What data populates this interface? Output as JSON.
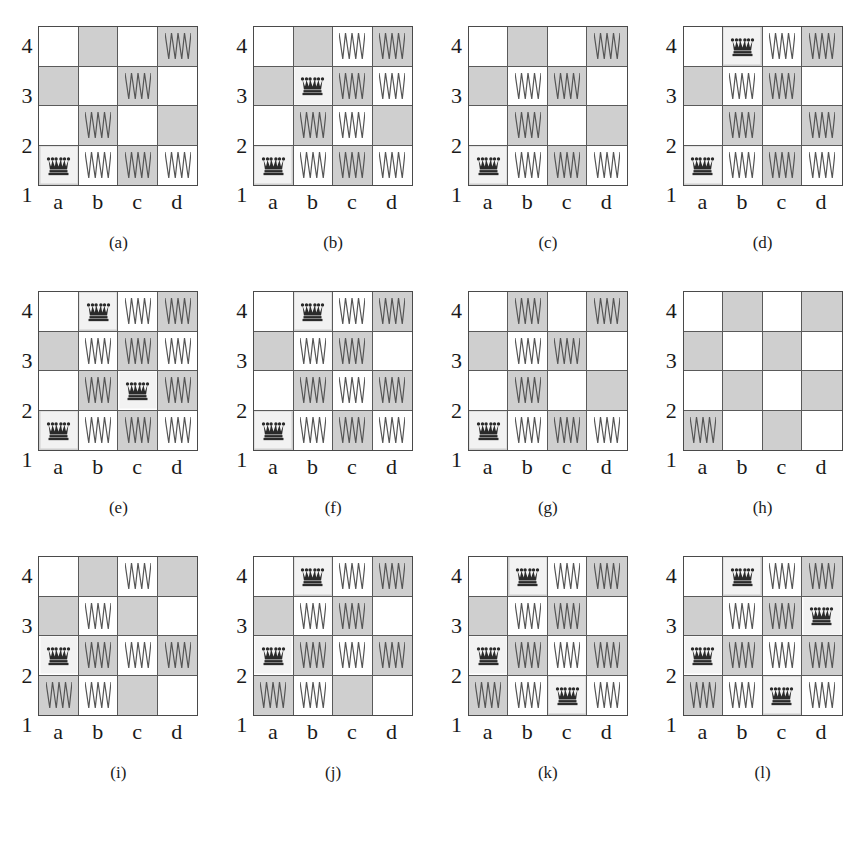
{
  "figure": {
    "colors": {
      "light_square": "#ffffff",
      "dark_square": "#cfcfcf",
      "border": "#4a4a4a",
      "queen": "#2a2a2a",
      "mark": "#555555",
      "queen_highlight": "#f2f2f2"
    },
    "board": {
      "files": [
        "a",
        "b",
        "c",
        "d"
      ],
      "ranks": [
        "4",
        "3",
        "2",
        "1"
      ],
      "size": 4
    },
    "panels": [
      {
        "caption": "(a)",
        "queens": [
          "a1"
        ],
        "marks": [
          "b1",
          "c1",
          "d1",
          "b2",
          "c3",
          "d4"
        ]
      },
      {
        "caption": "(b)",
        "queens": [
          "a1",
          "b3"
        ],
        "marks": [
          "b1",
          "c1",
          "d1",
          "b2",
          "c2",
          "c3",
          "d3",
          "c4",
          "d4"
        ]
      },
      {
        "caption": "(c)",
        "queens": [
          "a1"
        ],
        "marks": [
          "b1",
          "c1",
          "d1",
          "b2",
          "b3",
          "c3",
          "d4"
        ]
      },
      {
        "caption": "(d)",
        "queens": [
          "a1",
          "b4"
        ],
        "marks": [
          "b1",
          "c1",
          "d1",
          "b2",
          "d2",
          "b3",
          "c3",
          "c4",
          "d4"
        ]
      },
      {
        "caption": "(e)",
        "queens": [
          "a1",
          "c2",
          "b4"
        ],
        "marks": [
          "b1",
          "c1",
          "d1",
          "b2",
          "d2",
          "b3",
          "c3",
          "d3",
          "c4",
          "d4"
        ]
      },
      {
        "caption": "(f)",
        "queens": [
          "a1",
          "b4"
        ],
        "marks": [
          "b1",
          "c1",
          "d1",
          "b2",
          "c2",
          "d2",
          "b3",
          "c3",
          "c4",
          "d4"
        ]
      },
      {
        "caption": "(g)",
        "queens": [
          "a1"
        ],
        "marks": [
          "b1",
          "c1",
          "d1",
          "b2",
          "b3",
          "c3",
          "b4",
          "d4"
        ]
      },
      {
        "caption": "(h)",
        "queens": [],
        "marks": [
          "a1"
        ]
      },
      {
        "caption": "(i)",
        "queens": [
          "a2"
        ],
        "marks": [
          "a1",
          "b1",
          "b2",
          "c2",
          "d2",
          "b3",
          "c4"
        ]
      },
      {
        "caption": "(j)",
        "queens": [
          "a2",
          "b4"
        ],
        "marks": [
          "a1",
          "b1",
          "b2",
          "c2",
          "d2",
          "b3",
          "c3",
          "c4",
          "d4"
        ]
      },
      {
        "caption": "(k)",
        "queens": [
          "c1",
          "a2",
          "b4"
        ],
        "marks": [
          "a1",
          "b1",
          "d1",
          "b2",
          "c2",
          "d2",
          "b3",
          "c3",
          "c4",
          "d4"
        ]
      },
      {
        "caption": "(l)",
        "queens": [
          "c1",
          "a2",
          "d3",
          "b4"
        ],
        "marks": [
          "a1",
          "b1",
          "d1",
          "b2",
          "c2",
          "d2",
          "b3",
          "c3",
          "c4",
          "d4"
        ]
      }
    ]
  }
}
